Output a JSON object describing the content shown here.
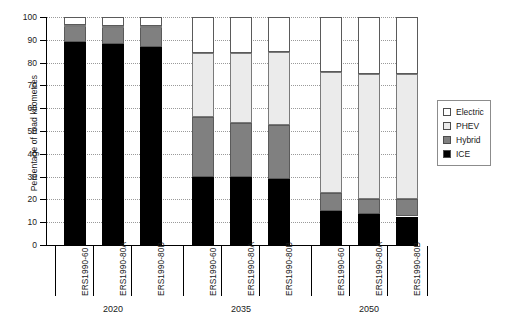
{
  "chart_data": {
    "type": "bar",
    "subtype": "stacked-bar",
    "title": "",
    "xlabel": "",
    "ylabel": "Percentage of road kilometres",
    "ylim": [
      0,
      100
    ],
    "ytick_labels": [
      "0",
      "10",
      "20",
      "30",
      "40",
      "50",
      "60",
      "70",
      "80",
      "90",
      "100"
    ],
    "ytick_values": [
      0,
      10,
      20,
      30,
      40,
      50,
      60,
      70,
      80,
      90,
      100
    ],
    "grid": true,
    "legend_position": "right",
    "categories": [
      "ERS1990-60",
      "ERS1990-80A",
      "ERS1990-80B",
      "ERS1990-60",
      "ERS1990-80A",
      "ERS1990-80B",
      "ERS1990-60",
      "ERS1990-80A",
      "ERS1990-80B"
    ],
    "groups": [
      {
        "label": "2020",
        "categories": [
          "ERS1990-60",
          "ERS1990-80A",
          "ERS1990-80B"
        ]
      },
      {
        "label": "2035",
        "categories": [
          "ERS1990-60",
          "ERS1990-80A",
          "ERS1990-80B"
        ]
      },
      {
        "label": "2050",
        "categories": [
          "ERS1990-60",
          "ERS1990-80A",
          "ERS1990-80B"
        ]
      }
    ],
    "series": [
      {
        "name": "ICE",
        "color": "#000000",
        "values": [
          89,
          88,
          87,
          30,
          30,
          29,
          15,
          13.5,
          12.5
        ]
      },
      {
        "name": "Hybrid",
        "color": "#808080",
        "values": [
          7,
          7.5,
          8.5,
          26,
          23.5,
          23.5,
          8,
          6.5,
          7.5
        ]
      },
      {
        "name": "PHEV",
        "color": "#ebebeb",
        "values": [
          0.5,
          0.5,
          0.5,
          28,
          30.5,
          32,
          53,
          55,
          55
        ]
      },
      {
        "name": "Electric",
        "color": "#ffffff",
        "values": [
          3.5,
          4,
          4,
          16,
          16,
          15.5,
          24,
          25,
          25
        ]
      }
    ],
    "stack_tops": [
      {
        "ice": 89,
        "hybrid": 96,
        "phev": 96.5,
        "electric": 100
      },
      {
        "ice": 88,
        "hybrid": 95.5,
        "phev": 96,
        "electric": 100
      },
      {
        "ice": 87,
        "hybrid": 95.5,
        "phev": 96,
        "electric": 100
      },
      {
        "ice": 30,
        "hybrid": 56,
        "phev": 84,
        "electric": 100
      },
      {
        "ice": 30,
        "hybrid": 53.5,
        "phev": 84,
        "electric": 100
      },
      {
        "ice": 29,
        "hybrid": 52.5,
        "phev": 84.5,
        "electric": 100
      },
      {
        "ice": 15,
        "hybrid": 23,
        "phev": 76,
        "electric": 100
      },
      {
        "ice": 13.5,
        "hybrid": 20,
        "phev": 75,
        "electric": 100
      },
      {
        "ice": 12.5,
        "hybrid": 20,
        "phev": 75,
        "electric": 100
      }
    ]
  },
  "legend": {
    "items": [
      {
        "label": "Electric",
        "color": "#ffffff"
      },
      {
        "label": "PHEV",
        "color": "#ebebeb"
      },
      {
        "label": "Hybrid",
        "color": "#808080"
      },
      {
        "label": "ICE",
        "color": "#000000"
      }
    ]
  }
}
